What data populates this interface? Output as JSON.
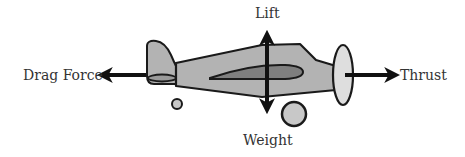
{
  "diagram": {
    "labels": {
      "lift": "Lift",
      "weight": "Weight",
      "drag": "Drag Force",
      "thrust": "Thrust"
    },
    "colors": {
      "fuselage": "#b3b3b3",
      "wing": "#7f7f7f",
      "propeller": "#dedede",
      "wheel": "#c8c8c8",
      "outline": "#1a1a1a",
      "arrow": "#111111",
      "text": "#333333"
    },
    "forces": [
      {
        "name": "Lift",
        "direction": "up"
      },
      {
        "name": "Weight",
        "direction": "down"
      },
      {
        "name": "Drag Force",
        "direction": "left"
      },
      {
        "name": "Thrust",
        "direction": "right"
      }
    ]
  }
}
